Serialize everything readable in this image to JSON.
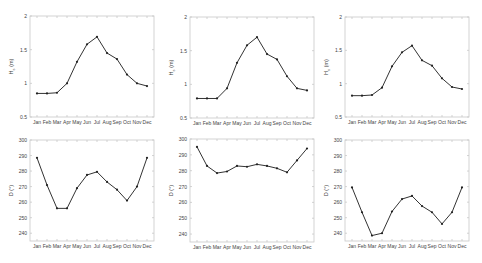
{
  "chart_data": [
    {
      "type": "line",
      "position": "top-left",
      "title": "",
      "xlabel": "",
      "ylabel": "H_s (m)",
      "ylabel_main": "H",
      "ylabel_sub": "s",
      "ylabel_unit": "(m)",
      "categories": [
        "Jan",
        "Feb",
        "Mar",
        "Apr",
        "May",
        "Jun",
        "Jul",
        "Aug",
        "Sep",
        "Oct",
        "Nov",
        "Dec"
      ],
      "values": [
        0.85,
        0.85,
        0.86,
        1.0,
        1.32,
        1.58,
        1.69,
        1.45,
        1.36,
        1.13,
        1.0,
        0.96
      ],
      "ylim": [
        0.5,
        2
      ],
      "yticks": [
        "0.5",
        "1",
        "1.5",
        "2"
      ],
      "grid": false
    },
    {
      "type": "line",
      "position": "top-middle",
      "title": "",
      "xlabel": "",
      "ylabel": "H_s (m)",
      "ylabel_main": "H",
      "ylabel_sub": "s",
      "ylabel_unit": "(m)",
      "categories": [
        "Jan",
        "Feb",
        "Mar",
        "Apr",
        "May",
        "Jun",
        "Jul",
        "Aug",
        "Sep",
        "Oct",
        "Nov",
        "Dec"
      ],
      "values": [
        0.79,
        0.79,
        0.79,
        0.94,
        1.32,
        1.58,
        1.7,
        1.45,
        1.37,
        1.12,
        0.94,
        0.91
      ],
      "ylim": [
        0.5,
        2
      ],
      "yticks": [
        "0.5",
        "1",
        "1.5",
        "2"
      ],
      "grid": false
    },
    {
      "type": "line",
      "position": "top-right",
      "title": "",
      "xlabel": "",
      "ylabel": "H_s (m)",
      "ylabel_main": "H",
      "ylabel_sub": "s",
      "ylabel_unit": "(m)",
      "categories": [
        "Jan",
        "Feb",
        "Mar",
        "Apr",
        "May",
        "Jun",
        "Jul",
        "Aug",
        "Sep",
        "Oct",
        "Nov",
        "Dec"
      ],
      "values": [
        0.82,
        0.82,
        0.83,
        0.94,
        1.26,
        1.47,
        1.57,
        1.35,
        1.27,
        1.08,
        0.95,
        0.92
      ],
      "ylim": [
        0.5,
        2
      ],
      "yticks": [
        "0.5",
        "1",
        "1.5",
        "2"
      ],
      "grid": false
    },
    {
      "type": "line",
      "position": "bottom-left",
      "title": "",
      "xlabel": "",
      "ylabel": "D (°)",
      "ylabel_main": "D",
      "ylabel_sub": "",
      "ylabel_unit": "(°)",
      "categories": [
        "Jan",
        "Feb",
        "Mar",
        "Apr",
        "May",
        "Jun",
        "Jul",
        "Aug",
        "Sep",
        "Oct",
        "Nov",
        "Dec"
      ],
      "values": [
        288.5,
        271,
        256,
        256,
        269,
        277.5,
        279.5,
        273,
        268,
        261,
        270,
        288.5
      ],
      "ylim": [
        235,
        300
      ],
      "yticks": [
        "240",
        "250",
        "260",
        "270",
        "280",
        "290",
        "300"
      ],
      "grid": false
    },
    {
      "type": "line",
      "position": "bottom-middle",
      "title": "",
      "xlabel": "",
      "ylabel": "D (°)",
      "ylabel_main": "D",
      "ylabel_sub": "",
      "ylabel_unit": "(°)",
      "categories": [
        "Jan",
        "Feb",
        "Mar",
        "Apr",
        "May",
        "Jun",
        "Jul",
        "Aug",
        "Sep",
        "Oct",
        "Nov",
        "Dec"
      ],
      "values": [
        295,
        283,
        278.5,
        279.5,
        283,
        282.5,
        284,
        283,
        281.5,
        279,
        286.5,
        294
      ],
      "ylim": [
        235,
        300
      ],
      "yticks": [
        "240",
        "250",
        "260",
        "270",
        "280",
        "290",
        "300"
      ],
      "grid": false
    },
    {
      "type": "line",
      "position": "bottom-right",
      "title": "",
      "xlabel": "",
      "ylabel": "D (°)",
      "ylabel_main": "D",
      "ylabel_sub": "",
      "ylabel_unit": "(°)",
      "categories": [
        "Jan",
        "Feb",
        "Mar",
        "Apr",
        "May",
        "Jun",
        "Jul",
        "Aug",
        "Sep",
        "Oct",
        "Nov",
        "Dec"
      ],
      "values": [
        269.5,
        253.5,
        238.5,
        240,
        254,
        262,
        264,
        257.5,
        253.5,
        246,
        253.5,
        269.5
      ],
      "ylim": [
        235,
        300
      ],
      "yticks": [
        "240",
        "250",
        "260",
        "270",
        "280",
        "290",
        "300"
      ],
      "grid": false
    }
  ],
  "style": {
    "line_color": "#333333",
    "marker_color": "#222222",
    "axis_color": "#c8c8c8",
    "tick_label_color": "#444444"
  },
  "layout": {
    "panels": [
      {
        "left": 30,
        "top": 16,
        "width": 124,
        "height": 101
      },
      {
        "left": 190,
        "top": 17,
        "width": 124,
        "height": 101
      },
      {
        "left": 345,
        "top": 17,
        "width": 124,
        "height": 100
      },
      {
        "left": 30,
        "top": 140,
        "width": 124,
        "height": 101
      },
      {
        "left": 190,
        "top": 139,
        "width": 124,
        "height": 103
      },
      {
        "left": 345,
        "top": 140,
        "width": 124,
        "height": 101
      }
    ]
  }
}
